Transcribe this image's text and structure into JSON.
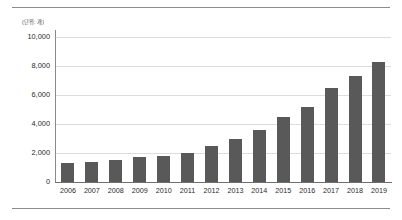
{
  "chart_data": {
    "type": "bar",
    "title": "",
    "subtitle": "",
    "unit_label": "(단위: 개)",
    "xlabel": "",
    "ylabel": "",
    "categories": [
      "2006",
      "2007",
      "2008",
      "2009",
      "2010",
      "2011",
      "2012",
      "2013",
      "2014",
      "2015",
      "2016",
      "2017",
      "2018",
      "2019"
    ],
    "values": [
      1300,
      1400,
      1500,
      1700,
      1800,
      2000,
      2500,
      3000,
      3600,
      4500,
      5200,
      6500,
      7300,
      8300
    ],
    "series": [
      {
        "name": "",
        "values": [
          1300,
          1400,
          1500,
          1700,
          1800,
          2000,
          2500,
          3000,
          3600,
          4500,
          5200,
          6500,
          7300,
          8300
        ]
      }
    ],
    "ylim": [
      0,
      10000
    ],
    "ytick_values": [
      10000,
      8000,
      6000,
      4000,
      2000,
      0
    ],
    "ytick_labels": [
      "10,000",
      "8,000",
      "6,000",
      "4,000",
      "2,000",
      "0"
    ],
    "grid": true,
    "grid_axis": "y",
    "legend": false,
    "legend_position": "none",
    "bar_color": "#595959",
    "gridline_color": "#dcdcdc",
    "axis_color": "#8a8a8a",
    "background_color": "#ffffff"
  },
  "decor": {
    "top_rule": true,
    "bottom_rule": true,
    "rule_color": "#8c8c8c"
  }
}
